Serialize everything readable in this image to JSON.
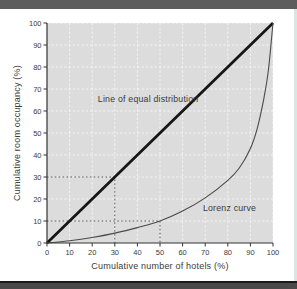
{
  "chart_data": {
    "type": "line",
    "title": "",
    "xlabel": "Cumulative number of hotels (%)",
    "ylabel": "Cumulative room occupancy (%)",
    "xlim": [
      0,
      100
    ],
    "ylim": [
      0,
      100
    ],
    "xticks": [
      0,
      10,
      20,
      30,
      40,
      50,
      60,
      70,
      80,
      90,
      100
    ],
    "yticks": [
      0,
      10,
      20,
      30,
      40,
      50,
      60,
      70,
      80,
      90,
      100
    ],
    "grid": true,
    "legend_position": "none",
    "series": [
      {
        "name": "Line of equal distribution",
        "style": "thick-solid",
        "points": [
          [
            0,
            0
          ],
          [
            100,
            100
          ]
        ]
      },
      {
        "name": "Lorenz curve",
        "style": "thin-smooth",
        "points": [
          [
            0,
            0
          ],
          [
            10,
            1
          ],
          [
            20,
            2.5
          ],
          [
            30,
            4.5
          ],
          [
            40,
            7
          ],
          [
            50,
            10
          ],
          [
            60,
            14.5
          ],
          [
            70,
            20.5
          ],
          [
            80,
            28.5
          ],
          [
            85,
            34
          ],
          [
            90,
            43
          ],
          [
            93,
            52
          ],
          [
            96,
            66
          ],
          [
            98,
            79
          ],
          [
            100,
            100
          ]
        ]
      }
    ],
    "reference_markers": [
      {
        "x": 30,
        "y": 30,
        "meaning": "equal distribution line at 30%"
      },
      {
        "x": 50,
        "y": 10,
        "meaning": "Lorenz curve: 50% of hotels give 10% occupancy"
      }
    ],
    "annotations": [
      {
        "text": "Line of equal distribution",
        "x": 67,
        "y": 64,
        "anchor": "end"
      },
      {
        "text": "Lorenz curve",
        "x": 69,
        "y": 14.5,
        "anchor": "start"
      }
    ]
  },
  "colors": {
    "plot_bg": "#dcdcdc",
    "grid": "#f7f7f7",
    "axis": "#333333",
    "text": "#3a3a3a",
    "equal_line": "#151515",
    "lorenz_line": "#4a4a4a",
    "dashed_ref": "#4d4d4d",
    "top_bar": "#5d5d5d",
    "bottom_bar": "#4a4a4a",
    "page_edge": "#d9e6e2"
  }
}
